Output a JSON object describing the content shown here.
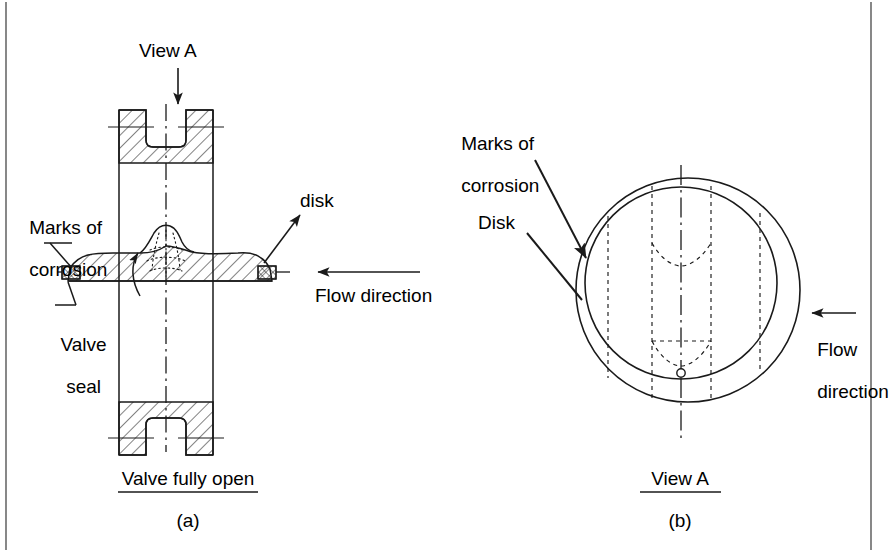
{
  "figure": {
    "title_present": false,
    "border_color": "#555555",
    "ink_color": "#1a1a1a",
    "panels": [
      {
        "id": "a",
        "caption": "(a)",
        "subtitle": "Valve fully open",
        "view_type": "sectional-side-view",
        "labels": [
          {
            "name": "view-a",
            "text": "View A"
          },
          {
            "name": "marks-of-corrosion",
            "text": "Marks of\ncorrosion",
            "line1": "Marks of",
            "line2": "corrosion"
          },
          {
            "name": "valve-seal",
            "text": "Valve\nseal",
            "line1": "Valve",
            "line2": "seal"
          },
          {
            "name": "disk",
            "text": "disk"
          },
          {
            "name": "flow-direction",
            "text": "Flow direction"
          }
        ]
      },
      {
        "id": "b",
        "caption": "(b)",
        "subtitle": "View A",
        "view_type": "front-view-through-bore",
        "labels": [
          {
            "name": "marks-of-corrosion",
            "line1": "Marks of",
            "line2": "corrosion"
          },
          {
            "name": "disk",
            "text": "Disk"
          },
          {
            "name": "flow-direction",
            "line1": "Flow",
            "line2": "direction"
          }
        ]
      }
    ]
  },
  "panel_a": {
    "view_a_label": "View A",
    "marks_line1": "Marks of",
    "marks_line2": "corrosion",
    "valve_seal_line1": "Valve",
    "valve_seal_line2": "seal",
    "disk_label": "disk",
    "flow_label": "Flow direction",
    "subtitle": "Valve fully open",
    "caption": "(a)"
  },
  "panel_b": {
    "marks_line1": "Marks of",
    "marks_line2": "corrosion",
    "disk_label": "Disk",
    "flow_line1": "Flow",
    "flow_line2": "direction",
    "subtitle": "View A",
    "caption": "(b)"
  }
}
